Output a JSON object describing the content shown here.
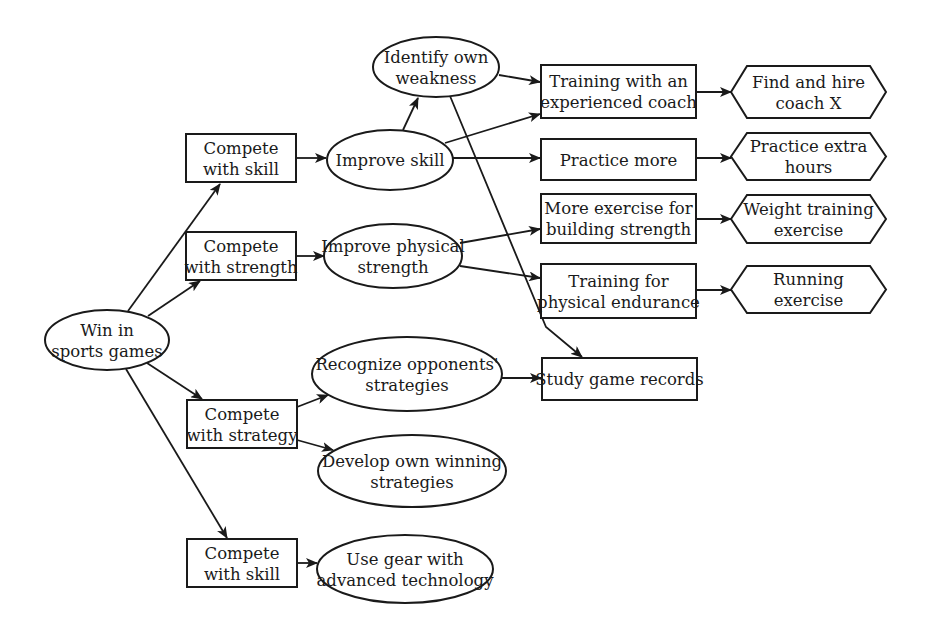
{
  "diagram": {
    "type": "goal-tree",
    "nodes": [
      {
        "id": "win",
        "shape": "ellipse",
        "cx": 107,
        "cy": 340,
        "rx": 62,
        "ry": 30,
        "lines": [
          "Win in",
          "sports games"
        ]
      },
      {
        "id": "skill1",
        "shape": "rect",
        "x": 186,
        "y": 134,
        "w": 110,
        "h": 48,
        "lines": [
          "Compete",
          "with skill"
        ]
      },
      {
        "id": "strength",
        "shape": "rect",
        "x": 186,
        "y": 232,
        "w": 110,
        "h": 48,
        "lines": [
          "Compete",
          "with strength"
        ]
      },
      {
        "id": "strategy",
        "shape": "rect",
        "x": 187,
        "y": 400,
        "w": 110,
        "h": 48,
        "lines": [
          "Compete",
          "with strategy"
        ]
      },
      {
        "id": "skill2",
        "shape": "rect",
        "x": 187,
        "y": 539,
        "w": 110,
        "h": 48,
        "lines": [
          "Compete",
          "with skill"
        ]
      },
      {
        "id": "improve_skill",
        "shape": "ellipse",
        "cx": 390,
        "cy": 160,
        "rx": 63,
        "ry": 30,
        "lines": [
          "Improve skill"
        ]
      },
      {
        "id": "improve_strength",
        "shape": "ellipse",
        "cx": 393,
        "cy": 256,
        "rx": 69,
        "ry": 32,
        "lines": [
          "Improve physical",
          "strength"
        ]
      },
      {
        "id": "identify",
        "shape": "ellipse",
        "cx": 436,
        "cy": 67,
        "rx": 63,
        "ry": 30,
        "lines": [
          "Identify own",
          "weakness"
        ]
      },
      {
        "id": "recognize",
        "shape": "ellipse",
        "cx": 407,
        "cy": 374,
        "rx": 95,
        "ry": 37,
        "lines": [
          "Recognize opponents'",
          "strategies"
        ]
      },
      {
        "id": "develop",
        "shape": "ellipse",
        "cx": 412,
        "cy": 471,
        "rx": 94,
        "ry": 36,
        "lines": [
          "Develop own winning",
          "strategies"
        ]
      },
      {
        "id": "gear",
        "shape": "ellipse",
        "cx": 405,
        "cy": 569,
        "rx": 88,
        "ry": 34,
        "lines": [
          "Use gear  with",
          "advanced technology"
        ]
      },
      {
        "id": "coach_training",
        "shape": "rect",
        "x": 541,
        "y": 65,
        "w": 155,
        "h": 53,
        "lines": [
          "Training with an",
          "experienced coach"
        ]
      },
      {
        "id": "practice_more",
        "shape": "rect",
        "x": 541,
        "y": 139,
        "w": 155,
        "h": 41,
        "lines": [
          "Practice more"
        ]
      },
      {
        "id": "more_exercise",
        "shape": "rect",
        "x": 541,
        "y": 194,
        "w": 155,
        "h": 49,
        "lines": [
          "More exercise for",
          "building strength"
        ]
      },
      {
        "id": "endurance",
        "shape": "rect",
        "x": 541,
        "y": 264,
        "w": 155,
        "h": 54,
        "lines": [
          "Training for",
          "physical endurance"
        ]
      },
      {
        "id": "study",
        "shape": "rect",
        "x": 542,
        "y": 358,
        "w": 155,
        "h": 42,
        "lines": [
          "Study game records"
        ]
      },
      {
        "id": "hire",
        "shape": "hexagon",
        "x": 731,
        "y": 66,
        "w": 155,
        "h": 52,
        "lines": [
          "Find and hire",
          "coach X"
        ]
      },
      {
        "id": "extra_hours",
        "shape": "hexagon",
        "x": 731,
        "y": 133,
        "w": 155,
        "h": 47,
        "lines": [
          "Practice extra",
          "hours"
        ]
      },
      {
        "id": "weight",
        "shape": "hexagon",
        "x": 731,
        "y": 195,
        "w": 155,
        "h": 48,
        "lines": [
          "Weight training",
          "exercise"
        ]
      },
      {
        "id": "running",
        "shape": "hexagon",
        "x": 731,
        "y": 266,
        "w": 155,
        "h": 47,
        "lines": [
          "Running",
          "exercise"
        ]
      }
    ],
    "edges": [
      {
        "from": "win",
        "to": "skill1",
        "path": [
          [
            128,
            311
          ],
          [
            220,
            184
          ]
        ]
      },
      {
        "from": "win",
        "to": "strength",
        "path": [
          [
            148,
            316
          ],
          [
            200,
            281
          ]
        ]
      },
      {
        "from": "win",
        "to": "strategy",
        "path": [
          [
            147,
            363
          ],
          [
            202,
            399
          ]
        ]
      },
      {
        "from": "win",
        "to": "skill2",
        "path": [
          [
            126,
            369
          ],
          [
            227,
            538
          ]
        ]
      },
      {
        "from": "skill1",
        "to": "improve_skill",
        "path": [
          [
            296,
            158
          ],
          [
            326,
            158
          ]
        ]
      },
      {
        "from": "strength",
        "to": "improve_strength",
        "path": [
          [
            296,
            256
          ],
          [
            324,
            256
          ]
        ]
      },
      {
        "from": "improve_skill",
        "to": "identify",
        "path": [
          [
            403,
            130
          ],
          [
            418,
            98
          ]
        ]
      },
      {
        "from": "improve_skill",
        "to": "coach_training",
        "path": [
          [
            445,
            143
          ],
          [
            540,
            114
          ]
        ]
      },
      {
        "from": "improve_skill",
        "to": "practice_more",
        "path": [
          [
            453,
            158
          ],
          [
            540,
            158
          ]
        ]
      },
      {
        "from": "identify",
        "to": "coach_training",
        "path": [
          [
            499,
            75
          ],
          [
            540,
            82
          ]
        ]
      },
      {
        "from": "identify",
        "to": "study",
        "path": [
          [
            450,
            96
          ],
          [
            546,
            327
          ],
          [
            582,
            357
          ]
        ]
      },
      {
        "from": "improve_strength",
        "to": "more_exercise",
        "path": [
          [
            460,
            243
          ],
          [
            540,
            229
          ]
        ]
      },
      {
        "from": "improve_strength",
        "to": "endurance",
        "path": [
          [
            460,
            266
          ],
          [
            540,
            278
          ]
        ]
      },
      {
        "from": "strategy",
        "to": "recognize",
        "path": [
          [
            297,
            407
          ],
          [
            328,
            395
          ]
        ]
      },
      {
        "from": "strategy",
        "to": "develop",
        "path": [
          [
            297,
            440
          ],
          [
            333,
            450
          ]
        ]
      },
      {
        "from": "recognize",
        "to": "study",
        "path": [
          [
            502,
            378
          ],
          [
            541,
            378
          ]
        ]
      },
      {
        "from": "skill2",
        "to": "gear",
        "path": [
          [
            297,
            563
          ],
          [
            317,
            563
          ]
        ]
      },
      {
        "from": "coach_training",
        "to": "hire",
        "path": [
          [
            696,
            92
          ],
          [
            731,
            92
          ]
        ]
      },
      {
        "from": "practice_more",
        "to": "extra_hours",
        "path": [
          [
            696,
            158
          ],
          [
            731,
            158
          ]
        ]
      },
      {
        "from": "more_exercise",
        "to": "weight",
        "path": [
          [
            696,
            219
          ],
          [
            731,
            219
          ]
        ]
      },
      {
        "from": "endurance",
        "to": "running",
        "path": [
          [
            696,
            290
          ],
          [
            731,
            290
          ]
        ]
      }
    ]
  }
}
